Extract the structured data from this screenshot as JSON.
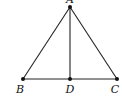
{
  "diagram": {
    "type": "geometry-triangle",
    "points": [
      {
        "id": "A",
        "label": "A",
        "x": 70,
        "y": 7,
        "lx": 70,
        "ly": 3
      },
      {
        "id": "B",
        "label": "B",
        "x": 23,
        "y": 79,
        "lx": 20,
        "ly": 93
      },
      {
        "id": "D",
        "label": "D",
        "x": 70,
        "y": 79,
        "lx": 70,
        "ly": 93
      },
      {
        "id": "C",
        "label": "C",
        "x": 117,
        "y": 79,
        "lx": 115,
        "ly": 93
      }
    ],
    "segments": [
      [
        "A",
        "B"
      ],
      [
        "A",
        "C"
      ],
      [
        "B",
        "C"
      ],
      [
        "A",
        "D"
      ]
    ],
    "colors": {
      "stroke": "#222222",
      "point": "#111111"
    }
  }
}
